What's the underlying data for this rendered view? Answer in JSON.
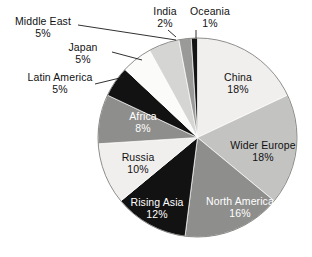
{
  "chart_data": {
    "type": "pie",
    "title": "",
    "xlabel": "",
    "ylabel": "",
    "legend_position": "none",
    "grid": false,
    "unit": "%",
    "total": 100,
    "categories": [
      "China",
      "Wider Europe",
      "North America",
      "Rising Asia",
      "Russia",
      "Africa",
      "Latin America",
      "Japan",
      "Middle East",
      "India",
      "Oceania"
    ],
    "values": [
      18,
      18,
      16,
      12,
      10,
      8,
      5,
      5,
      5,
      2,
      1
    ],
    "labels": [
      "18%",
      "18%",
      "16%",
      "12%",
      "10%",
      "8%",
      "5%",
      "5%",
      "5%",
      "2%",
      "1%"
    ],
    "colors": [
      "#f0efed",
      "#c3c3c1",
      "#8e8e8c",
      "#121212",
      "#f0efed",
      "#8e8e8c",
      "#121212",
      "#fbfbfa",
      "#d5d5d3",
      "#9a9a98",
      "#141414"
    ],
    "start_angle_deg": 0,
    "direction": "clockwise",
    "slices": [
      {
        "name": "China",
        "value": 18,
        "label": "China",
        "pct": "18%",
        "color": "#f0efed",
        "label_placement": "inside",
        "text_color": "#111111"
      },
      {
        "name": "Wider Europe",
        "value": 18,
        "label": "Wider Europe",
        "pct": "18%",
        "color": "#c3c3c1",
        "label_placement": "inside",
        "text_color": "#111111"
      },
      {
        "name": "North America",
        "value": 16,
        "label": "North America",
        "pct": "16%",
        "color": "#8e8e8c",
        "label_placement": "inside",
        "text_color": "#ffffff"
      },
      {
        "name": "Rising Asia",
        "value": 12,
        "label": "Rising Asia",
        "pct": "12%",
        "color": "#121212",
        "label_placement": "inside",
        "text_color": "#ffffff"
      },
      {
        "name": "Russia",
        "value": 10,
        "label": "Russia",
        "pct": "10%",
        "color": "#f0efed",
        "label_placement": "inside",
        "text_color": "#111111"
      },
      {
        "name": "Africa",
        "value": 8,
        "label": "Africa",
        "pct": "8%",
        "color": "#8e8e8c",
        "label_placement": "inside",
        "text_color": "#ffffff"
      },
      {
        "name": "Latin America",
        "value": 5,
        "label": "Latin America",
        "pct": "5%",
        "color": "#121212",
        "label_placement": "outside",
        "text_color": "#111111"
      },
      {
        "name": "Japan",
        "value": 5,
        "label": "Japan",
        "pct": "5%",
        "color": "#fbfbfa",
        "label_placement": "outside",
        "text_color": "#111111"
      },
      {
        "name": "Middle East",
        "value": 5,
        "label": "Middle East",
        "pct": "5%",
        "color": "#d5d5d3",
        "label_placement": "outside",
        "text_color": "#111111"
      },
      {
        "name": "India",
        "value": 2,
        "label": "India",
        "pct": "2%",
        "color": "#9a9a98",
        "label_placement": "outside",
        "text_color": "#111111"
      },
      {
        "name": "Oceania",
        "value": 1,
        "label": "Oceania",
        "pct": "1%",
        "color": "#141414",
        "label_placement": "outside",
        "text_color": "#111111"
      }
    ]
  }
}
